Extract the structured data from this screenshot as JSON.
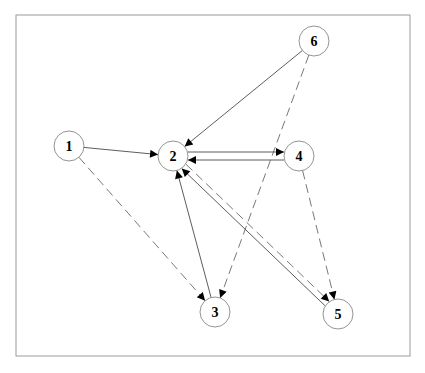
{
  "diagram": {
    "frame": {
      "x": 16,
      "y": 15,
      "w": 394,
      "h": 341,
      "stroke": "#9a9a9a"
    },
    "node_radius": 15,
    "nodes": [
      {
        "id": "1",
        "label": "1",
        "x": 69,
        "y": 146
      },
      {
        "id": "2",
        "label": "2",
        "x": 173,
        "y": 156
      },
      {
        "id": "3",
        "label": "3",
        "x": 215,
        "y": 312
      },
      {
        "id": "4",
        "label": "4",
        "x": 299,
        "y": 156
      },
      {
        "id": "5",
        "label": "5",
        "x": 338,
        "y": 314
      },
      {
        "id": "6",
        "label": "6",
        "x": 314,
        "y": 41
      }
    ],
    "edges": [
      {
        "from": "1",
        "to": "2",
        "style": "solid"
      },
      {
        "from": "1",
        "to": "3",
        "style": "dashed"
      },
      {
        "from": "6",
        "to": "2",
        "style": "solid"
      },
      {
        "from": "6",
        "to": "3",
        "style": "dashed"
      },
      {
        "from": "2",
        "to": "4",
        "style": "solid",
        "offset": -4
      },
      {
        "from": "4",
        "to": "2",
        "style": "solid",
        "offset": -4
      },
      {
        "from": "4",
        "to": "5",
        "style": "dashed"
      },
      {
        "from": "3",
        "to": "2",
        "style": "solid"
      },
      {
        "from": "5",
        "to": "2",
        "style": "solid",
        "offset": -3
      },
      {
        "from": "2",
        "to": "5",
        "style": "dashed",
        "offset": -3
      }
    ]
  }
}
